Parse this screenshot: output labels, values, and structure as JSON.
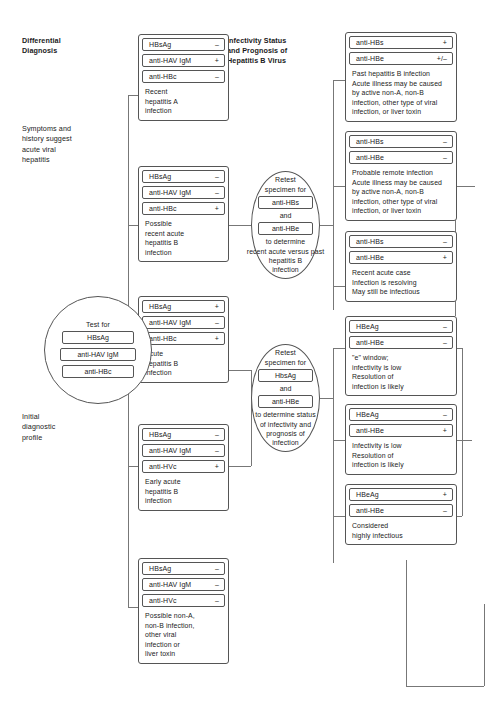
{
  "headings": {
    "differential_diagnosis": "Differential\nDiagnosis",
    "infectivity": "Infectivity Status\nand Prognosis of\nHepatitis B Virus"
  },
  "left_notes": {
    "symptoms": "Symptoms and\nhistory suggest\nacute viral\nhepatitis",
    "initial": "Initial\ndiagnostic\nprofile"
  },
  "test_circle": {
    "title": "Test for",
    "items": [
      "HBsAg",
      "anti-HAV IgM",
      "anti-HBc"
    ]
  },
  "retest_circle_1": {
    "title": "Retest\nspecimen for",
    "item1": "anti-HBs",
    "conjunction": "and",
    "item2": "anti-HBe",
    "footer": "to determine\nrecent acute versus past\nhepatitis B\ninfection"
  },
  "retest_circle_2": {
    "title": "Retest\nspecimen for",
    "item1": "HbsAg",
    "conjunction": "and",
    "item2": "anti-HBe",
    "footer": "to determine status\nof infectivity and\nprognosis of\ninfection"
  },
  "middle_groups": [
    {
      "assays": [
        {
          "name": "HBsAg",
          "sign": "–"
        },
        {
          "name": "anti-HAV IgM",
          "sign": "+"
        },
        {
          "name": "anti-HBc",
          "sign": "–"
        }
      ],
      "conclusion": "Recent\nhepatitis A\ninfection"
    },
    {
      "assays": [
        {
          "name": "HBsAg",
          "sign": "–"
        },
        {
          "name": "anti-HAV IgM",
          "sign": "–"
        },
        {
          "name": "anti-HBc",
          "sign": "+"
        }
      ],
      "conclusion": "Possible\nrecent acute\nhepatitis B\ninfection"
    },
    {
      "assays": [
        {
          "name": "HBsAg",
          "sign": "+"
        },
        {
          "name": "anti-HAV IgM",
          "sign": "–"
        },
        {
          "name": "anti-HBc",
          "sign": "+"
        }
      ],
      "conclusion": "Acute\nhepatitis B\ninfection"
    },
    {
      "assays": [
        {
          "name": "HBsAg",
          "sign": "–"
        },
        {
          "name": "anti-HAV IgM",
          "sign": "–"
        },
        {
          "name": "anti-HVc",
          "sign": "+"
        }
      ],
      "conclusion": "Early acute\nhepatitis B\ninfection"
    },
    {
      "assays": [
        {
          "name": "HBsAg",
          "sign": "–"
        },
        {
          "name": "anti-HAV IgM",
          "sign": "–"
        },
        {
          "name": "anti-HVc",
          "sign": "–"
        }
      ],
      "conclusion": "Possible non-A,\nnon-B infection,\nother viral\ninfection or\nliver toxin"
    }
  ],
  "right_groups": [
    {
      "assays": [
        {
          "name": "anti-HBs",
          "sign": "+"
        },
        {
          "name": "anti-HBe",
          "sign": "+/–"
        }
      ],
      "conclusion": "Past hepatitis B infection\nAcute illness may be caused\nby active non-A, non-B\ninfection, other type of viral\ninfection, or liver toxin"
    },
    {
      "assays": [
        {
          "name": "anti-HBs",
          "sign": "–"
        },
        {
          "name": "anti-HBe",
          "sign": "–"
        }
      ],
      "conclusion": "Probable remote infection\nAcute illness may be caused\nby active non-A, non-B\ninfection, other type of viral\ninfection, or liver toxin"
    },
    {
      "assays": [
        {
          "name": "anti-HBs",
          "sign": "–"
        },
        {
          "name": "anti-HBe",
          "sign": "+"
        }
      ],
      "conclusion": "Recent acute case\nInfection is resolving\nMay still be infectious"
    },
    {
      "assays": [
        {
          "name": "HBeAg",
          "sign": "–"
        },
        {
          "name": "anti-HBe",
          "sign": "–"
        }
      ],
      "conclusion": "\"e\" window;\ninfectivity is low\nResolution of\ninfection is likely"
    },
    {
      "assays": [
        {
          "name": "HBeAg",
          "sign": "–"
        },
        {
          "name": "anti-HBe",
          "sign": "+"
        }
      ],
      "conclusion": "Infectivity is low\nResolution of\ninfection is likely"
    },
    {
      "assays": [
        {
          "name": "HBeAg",
          "sign": "+"
        },
        {
          "name": "anti-HBe",
          "sign": "–"
        }
      ],
      "conclusion": "Considered\nhighly infectious"
    }
  ]
}
